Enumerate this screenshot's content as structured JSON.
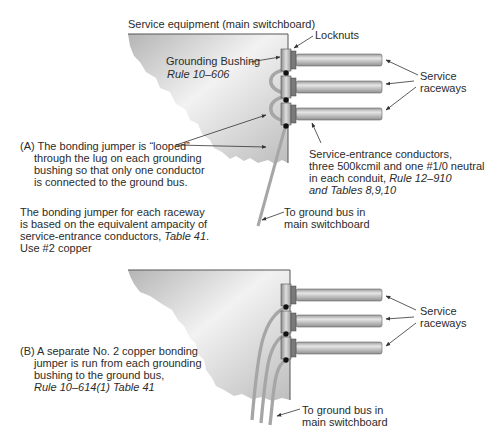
{
  "panel_a": {
    "title": "Service equipment (main switchboard)",
    "locknuts": "Locknuts",
    "grounding_bushing": "Grounding Bushing",
    "grounding_bushing_rule": "Rule 10–606",
    "service_raceways_1": "Service",
    "service_raceways_2": "raceways",
    "caption_lines": [
      "(A) The bonding jumper is “looped”",
      "through the lug on each grounding",
      "bushing so that only one conductor",
      "is connected to the ground bus."
    ],
    "conductors_lines": [
      "Service-entrance conductors,",
      "three 500kcmil and one #1/0 neutral",
      "in each conduit, ",
      "Rule 12–910",
      "and Tables 8,9,10"
    ],
    "ground_bus_1": "To ground bus in",
    "ground_bus_2": "main switchboard",
    "note_lines": [
      "The bonding jumper for each raceway",
      "is based on the equivalent ampacity of",
      "service-entrance conductors, ",
      "Table 41",
      ".",
      "Use #2 copper"
    ]
  },
  "panel_b": {
    "service_raceways_1": "Service",
    "service_raceways_2": "raceways",
    "caption_lines": [
      "(B) A separate No. 2 copper bonding",
      "jumper is run from each grounding",
      "bushing to the ground bus,",
      "Rule 10–614(1) Table 41"
    ],
    "ground_bus_1": "To ground bus in",
    "ground_bus_2": "main switchboard"
  },
  "colors": {
    "panel_fill_dark": "#b9b9b9",
    "panel_fill_light": "#eeeeee",
    "raceway": "#c4c4c4",
    "jumper": "#a8a8a8",
    "lug": "#111111"
  }
}
